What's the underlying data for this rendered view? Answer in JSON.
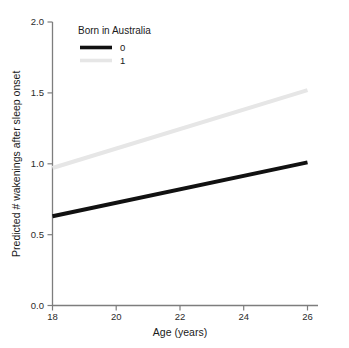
{
  "chart_data": {
    "type": "line",
    "title": "",
    "xlabel": "Age (years)",
    "ylabel": "Predicted # wakenings after sleep onset",
    "xlim": [
      18,
      26
    ],
    "ylim": [
      0.0,
      2.0
    ],
    "xticks": [
      "18",
      "20",
      "22",
      "24",
      "26"
    ],
    "xtick_values": [
      18,
      20,
      22,
      24,
      26
    ],
    "yticks": [
      "0.0",
      "0.5",
      "1.0",
      "1.5",
      "2.0"
    ],
    "ytick_values": [
      0.0,
      0.5,
      1.0,
      1.5,
      2.0
    ],
    "grid": false,
    "legend_position": "top-left-inside",
    "legend_title": "Born in Australia",
    "x": [
      18,
      26
    ],
    "series": [
      {
        "name": "0",
        "color": "#111111",
        "linewidth": 3.2,
        "values": [
          0.63,
          1.01
        ]
      },
      {
        "name": "1",
        "color": "#e6e6e6",
        "linewidth": 3.2,
        "values": [
          0.97,
          1.52
        ]
      }
    ],
    "axis_color": "#7d7d7d",
    "background_color": "#ffffff"
  },
  "legend": {
    "title": "Born in Australia",
    "entries": [
      {
        "label": "0",
        "color": "#111111"
      },
      {
        "label": "1",
        "color": "#e6e6e6"
      }
    ]
  },
  "axes": {
    "x_label": "Age (years)",
    "y_label": "Predicted # wakenings after sleep onset",
    "x_tick_labels": [
      "18",
      "20",
      "22",
      "24",
      "26"
    ],
    "y_tick_labels": [
      "0.0",
      "0.5",
      "1.0",
      "1.5",
      "2.0"
    ]
  }
}
